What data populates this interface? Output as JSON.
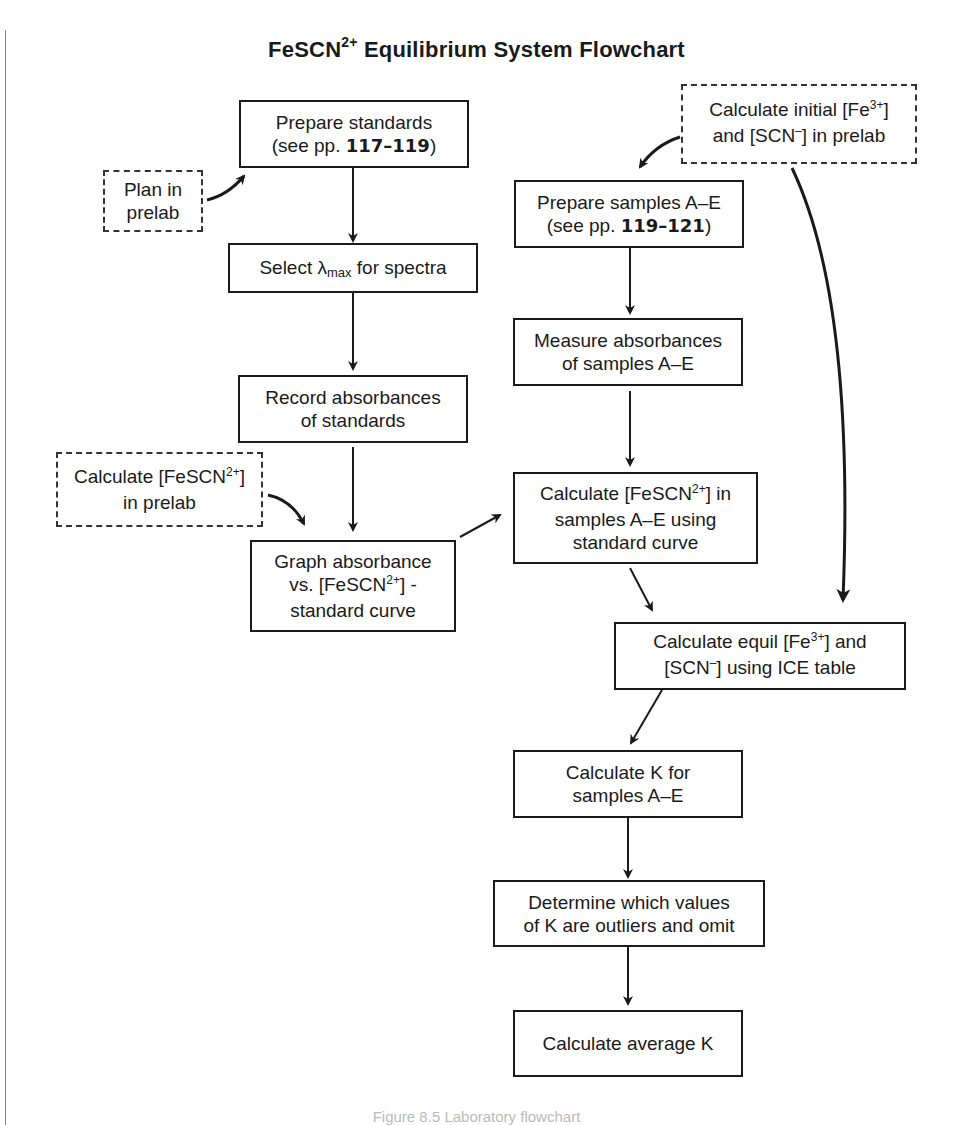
{
  "title": {
    "main": "FeSCN",
    "superscript": "2+",
    "rest": " Equilibrium System Flowchart"
  },
  "nodes": {
    "prepare_standards": {
      "line1": "Prepare standards",
      "line2_pre": "(see pp. ",
      "line2_bold": "117–119",
      "line2_post": ")"
    },
    "plan_in_prelab": {
      "line1": "Plan in",
      "line2": "prelab"
    },
    "select_lambda": {
      "pre": "Select ",
      "lambda": "λ",
      "sub": "max",
      "post": " for spectra"
    },
    "record_absorbances": {
      "line1": "Record absorbances",
      "line2": "of standards"
    },
    "calc_fescn_prelab": {
      "line1_pre": "Calculate [FeSCN",
      "line1_sup": "2+",
      "line1_post": "]",
      "line2": "in prelab"
    },
    "graph_absorbance": {
      "line1": "Graph absorbance",
      "line2_pre": "vs. [FeSCN",
      "line2_sup": "2+",
      "line2_post": "] -",
      "line3": "standard curve"
    },
    "calc_initial": {
      "line1_pre": "Calculate initial [Fe",
      "line1_sup": "3+",
      "line1_post": "]",
      "line2_pre": "and [SCN",
      "line2_sup": "–",
      "line2_post": "] in prelab"
    },
    "prepare_samples": {
      "line1": "Prepare samples A–E",
      "line2_pre": "(see pp. ",
      "line2_bold": "119–121",
      "line2_post": ")"
    },
    "measure_absorbances": {
      "line1": "Measure absorbances",
      "line2": "of samples A–E"
    },
    "calc_fescn_samples": {
      "line1_pre": "Calculate [FeSCN",
      "line1_sup": "2+",
      "line1_post": "] in",
      "line2": "samples A–E using",
      "line3": "standard curve"
    },
    "calc_equil": {
      "line1_pre": "Calculate equil [Fe",
      "line1_sup": "3+",
      "line1_post": "] and",
      "line2_pre": "[SCN",
      "line2_sup": "–",
      "line2_post": "] using ICE table"
    },
    "calc_k": {
      "line1": "Calculate K for",
      "line2": "samples A–E"
    },
    "determine_outliers": {
      "line1": "Determine which values",
      "line2": "of K are outliers and omit"
    },
    "calc_average_k": {
      "line1": "Calculate average K"
    }
  },
  "caption": "Figure 8.5  Laboratory flowchart"
}
